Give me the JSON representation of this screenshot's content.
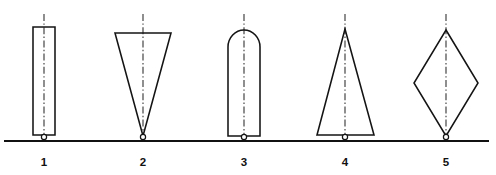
{
  "figure": {
    "background_color": "#ffffff",
    "line_color": "#141414",
    "baseline_color": "#111111",
    "centerline_color": "#2a2a2a",
    "header_text": "",
    "baseline": {
      "y": 141,
      "x_start": 4,
      "x_end": 489
    },
    "shapes": [
      {
        "number": "1",
        "name": "rectangle",
        "label_x": 44,
        "label_y": 166,
        "center_x": 44,
        "pivot": {
          "cx": 44,
          "cy": 137,
          "r": 2.6
        },
        "centerline": {
          "x": 44,
          "y_top": 14,
          "y_bottom": 141
        },
        "outline_points": "33,27 55,27 55,135 33,135"
      },
      {
        "number": "2",
        "name": "inverted-triangle",
        "label_x": 143,
        "label_y": 166,
        "center_x": 143,
        "pivot": {
          "cx": 143,
          "cy": 137,
          "r": 2.6
        },
        "centerline": {
          "x": 143,
          "y_top": 14,
          "y_bottom": 141
        },
        "outline_points": "115,33 171,33 143,136"
      },
      {
        "number": "3",
        "name": "dome-topped-rectangle",
        "label_x": 244,
        "label_y": 166,
        "center_x": 244,
        "pivot": {
          "cx": 244,
          "cy": 137,
          "r": 2.6
        },
        "centerline": {
          "x": 244,
          "y_top": 14,
          "y_bottom": 141
        },
        "outline_path": "M 228,136 L 228,47 A 16 17 0 0 1 260,47 L 260,136 Z"
      },
      {
        "number": "4",
        "name": "upright-triangle",
        "label_x": 345,
        "label_y": 166,
        "center_x": 345,
        "pivot": {
          "cx": 345,
          "cy": 137,
          "r": 2.6
        },
        "centerline": {
          "x": 345,
          "y_top": 14,
          "y_bottom": 141
        },
        "outline_points": "345,29 374,135 317,135"
      },
      {
        "number": "5",
        "name": "rhombus",
        "label_x": 446,
        "label_y": 166,
        "center_x": 446,
        "pivot": {
          "cx": 446,
          "cy": 137,
          "r": 2.6
        },
        "centerline": {
          "x": 446,
          "y_top": 14,
          "y_bottom": 141
        },
        "outline_points": "446,30 478,83 446,136 414,83"
      }
    ]
  }
}
